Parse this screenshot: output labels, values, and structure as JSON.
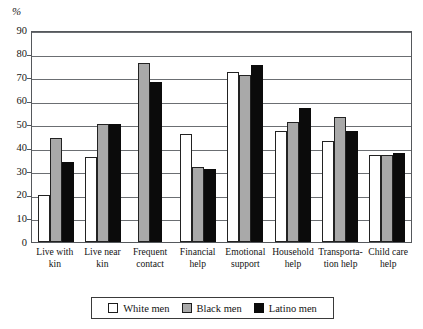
{
  "chart_data": {
    "type": "bar",
    "title": "",
    "xlabel": "",
    "ylabel": "%",
    "ylim": [
      0,
      90
    ],
    "ytick_step": 10,
    "yticks": [
      90,
      80,
      70,
      60,
      50,
      40,
      30,
      20,
      10,
      0
    ],
    "grid": true,
    "legend_position": "bottom",
    "categories": [
      "Live with kin",
      "Live near kin",
      "Frequent contact",
      "Financial help",
      "Emotional support",
      "Household help",
      "Transporta- tion help",
      "Child care help"
    ],
    "series": [
      {
        "name": "White men",
        "color": "#ffffff",
        "values": [
          20,
          36,
          0,
          46,
          72,
          47,
          43,
          37
        ]
      },
      {
        "name": "Black men",
        "color": "#a9a9a9",
        "values": [
          44,
          50,
          76,
          32,
          71,
          51,
          53,
          37
        ]
      },
      {
        "name": "Latino men",
        "color": "#0b0b0b",
        "values": [
          34,
          50,
          68,
          31,
          75,
          57,
          47,
          38
        ]
      }
    ]
  },
  "axis": {
    "unit_label": "%"
  },
  "legend": {
    "items": [
      {
        "label": "White men",
        "swatch": "white-swatch-icon"
      },
      {
        "label": "Black men",
        "swatch": "gray-swatch-icon"
      },
      {
        "label": "Latino men",
        "swatch": "black-swatch-icon"
      }
    ]
  }
}
